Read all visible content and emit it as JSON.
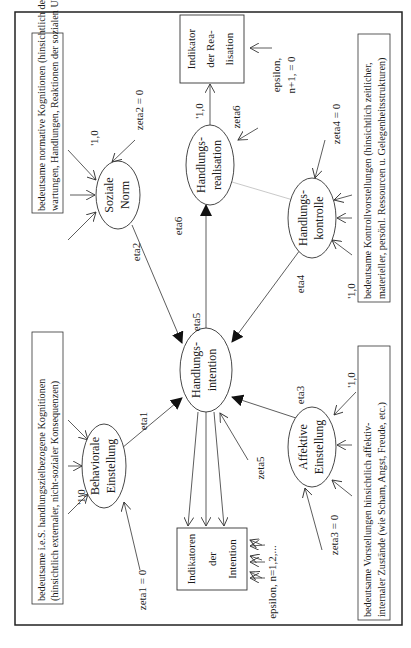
{
  "diagram": {
    "frame": {
      "border_color": "#222222"
    },
    "latent_variables": {
      "soziale_norm": {
        "line1": "Soziale",
        "line2": "Norm",
        "eta": "eta2",
        "zeta": "zeta2 = 0",
        "loading": "'1,0"
      },
      "behaviorale_einstellung": {
        "line1": "Behaviorale",
        "line2": "Einstellung",
        "eta": "eta1",
        "zeta": "zeta1 = 0",
        "loading": "'1,0"
      },
      "handlungsintention": {
        "line1": "Handlungs-",
        "line2": "intention",
        "eta": "eta5",
        "zeta": "zeta5"
      },
      "handlungsrealisation": {
        "line1": "Handlungs-",
        "line2": "realisation",
        "eta": "eta6",
        "zeta": "zeta6",
        "loading": "'1,0"
      },
      "handlungskontrolle": {
        "line1": "Handlungs-",
        "line2": "kontrolle",
        "eta": "eta4",
        "zeta": "zeta4 = 0",
        "loading": "'1,0"
      },
      "affektive_einstellung": {
        "line1": "Affektive",
        "line2": "Einstellung",
        "eta": "eta3",
        "zeta": "zeta3 = 0",
        "loading": "'1,0"
      }
    },
    "indicators": {
      "realisation": {
        "line1": "Indikator",
        "line2": "der Rea-",
        "line3": "lisation",
        "epsilon1": "epsilon,",
        "epsilon2": "n+1, = 0"
      },
      "intention": {
        "line1": "Indikatoren",
        "line2": "der",
        "line3": "Intention",
        "epsilon": "epsilon, n=1,2,..."
      }
    },
    "annotation_boxes": {
      "social": {
        "line1": "bedeutsame normative Kognitionen (hinsichtlich der Er-",
        "line2": "wartungen, Handlungen, Reaktionen der sozialen Umwelt)"
      },
      "behavioral": {
        "line1": "bedeutsame i.e.S. handlungszielbezogene Kognitionen",
        "line2": "(hinsichtlich externaler, nicht-sozialer Konsequenzen)"
      },
      "control": {
        "line1": "bedeutsame Kontrollvorstellungen (hinsichtlich zeitlicher,",
        "line2": "materieller, persönl. Ressourcen u. Gelegenheitsstrukturen)"
      },
      "affective": {
        "line1": "bedeutsame Vorstellungen hinsichtlich affektiv-",
        "line2": "internaler Zustände (wie Scham, Angst, Freude, etc.)"
      }
    }
  }
}
